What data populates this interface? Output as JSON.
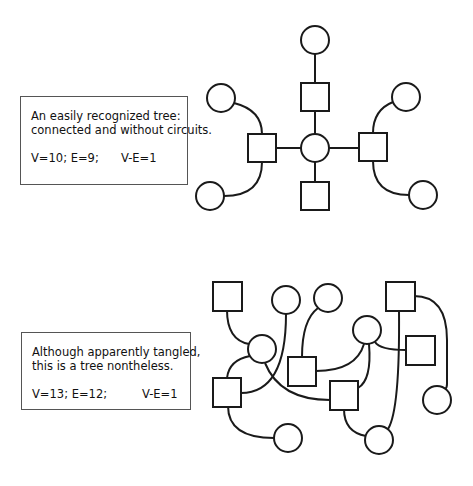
{
  "figures": [
    {
      "caption": {
        "lines": [
          "An easily recognized tree:",
          "connected and without circuits."
        ],
        "vertices": "V=10; E=9;",
        "difference": "V-E=1"
      },
      "graph": {
        "vertex_count": 10,
        "edge_count": 9,
        "nodes": [
          {
            "id": "a",
            "shape": "circle",
            "cx": 315,
            "cy": 40
          },
          {
            "id": "b",
            "shape": "square",
            "cx": 315,
            "cy": 97
          },
          {
            "id": "c",
            "shape": "circle",
            "cx": 315,
            "cy": 148
          },
          {
            "id": "d",
            "shape": "square",
            "cx": 262,
            "cy": 148
          },
          {
            "id": "e",
            "shape": "square",
            "cx": 373,
            "cy": 147
          },
          {
            "id": "f",
            "shape": "square",
            "cx": 315,
            "cy": 196
          },
          {
            "id": "g",
            "shape": "circle",
            "cx": 221,
            "cy": 98
          },
          {
            "id": "h",
            "shape": "circle",
            "cx": 406,
            "cy": 97
          },
          {
            "id": "i",
            "shape": "circle",
            "cx": 210,
            "cy": 196
          },
          {
            "id": "j",
            "shape": "circle",
            "cx": 423,
            "cy": 195
          }
        ]
      }
    },
    {
      "caption": {
        "lines": [
          "Although apparently tangled,",
          "this is a tree nontheless."
        ],
        "vertices": "V=13; E=12;",
        "difference": "V-E=1"
      },
      "graph": {
        "vertex_count": 13,
        "edge_count": 12,
        "nodes": [
          {
            "id": "A",
            "shape": "square",
            "cx": 227,
            "cy": 296
          },
          {
            "id": "B",
            "shape": "circle",
            "cx": 286,
            "cy": 300
          },
          {
            "id": "C",
            "shape": "circle",
            "cx": 328,
            "cy": 298
          },
          {
            "id": "D",
            "shape": "square",
            "cx": 400,
            "cy": 296
          },
          {
            "id": "E",
            "shape": "circle",
            "cx": 262,
            "cy": 349
          },
          {
            "id": "F",
            "shape": "circle",
            "cx": 367,
            "cy": 330
          },
          {
            "id": "G",
            "shape": "square",
            "cx": 302,
            "cy": 371
          },
          {
            "id": "H",
            "shape": "square",
            "cx": 420,
            "cy": 350
          },
          {
            "id": "I",
            "shape": "square",
            "cx": 227,
            "cy": 392
          },
          {
            "id": "J",
            "shape": "square",
            "cx": 344,
            "cy": 395
          },
          {
            "id": "K",
            "shape": "circle",
            "cx": 437,
            "cy": 400
          },
          {
            "id": "L",
            "shape": "circle",
            "cx": 288,
            "cy": 438
          },
          {
            "id": "M",
            "shape": "circle",
            "cx": 379,
            "cy": 440
          }
        ]
      }
    }
  ]
}
